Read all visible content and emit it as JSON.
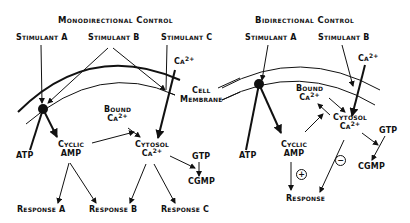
{
  "left_panel": {
    "title": "Monodirectional Control",
    "stimulant_a": "Stimulant A",
    "stimulant_b": "Stimulant B",
    "stimulant_c": "Stimulant C",
    "ca_ion": "Ca",
    "ca_charge": "2+",
    "cell_membrane_line1": "Cell",
    "cell_membrane_line2": "Membrane",
    "bound_line1": "Bound",
    "bound_ca": "Ca",
    "bound_charge": "2+",
    "atp": "ATP",
    "cyclic_line1": "Cyclic",
    "cyclic_line2": "AMP",
    "cytosol_line1": "Cytosol",
    "cytosol_ca": "Ca",
    "cytosol_charge": "2+",
    "gtp": "GTP",
    "cgmp": "CGMP",
    "response_a": "Response A",
    "response_b": "Response B",
    "response_c": "Response C"
  },
  "right_panel": {
    "title": "Bidirectional Control",
    "stimulant_a": "Stimulant A",
    "stimulant_b": "Stimulant B",
    "ca_ion": "Ca",
    "ca_charge": "2+",
    "bound_line1": "Bound",
    "bound_ca": "Ca",
    "bound_charge": "2+",
    "atp": "ATP",
    "cyclic_line1": "Cyclic",
    "cyclic_line2": "AMP",
    "cytosol_line1": "Cytosol",
    "cytosol_ca": "Ca",
    "cytosol_charge": "2+",
    "gtp": "GTP",
    "cgmp": "CGMP",
    "response": "Response",
    "plus_sign": "+",
    "minus_sign": "−"
  }
}
